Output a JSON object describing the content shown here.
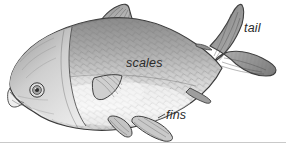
{
  "figure": {
    "style": "grayscale pencil drawing",
    "background_color": "#ffffff",
    "orientation": "facing left",
    "labels": [
      {
        "id": "scales",
        "text": "scales",
        "x": 126,
        "y": 57
      },
      {
        "id": "tail",
        "text": "tail",
        "x": 244,
        "y": 22
      },
      {
        "id": "fins",
        "text": "fins",
        "x": 166,
        "y": 109
      }
    ],
    "parts": [
      "dorsal-fin",
      "caudal-fin",
      "pectoral-fin",
      "pelvic-fin",
      "anal-fin",
      "eye",
      "mouth",
      "gill-cover",
      "scaled-body"
    ],
    "colors": {
      "outline": "#3a3a3a",
      "body_dark": "#8e8e8e",
      "body_mid": "#b4b4b4",
      "body_light": "#e6e6e6",
      "fin_fill": "#9a9a9a",
      "label_text": "#2b2b2b",
      "rule": "#c9c9c9"
    }
  }
}
